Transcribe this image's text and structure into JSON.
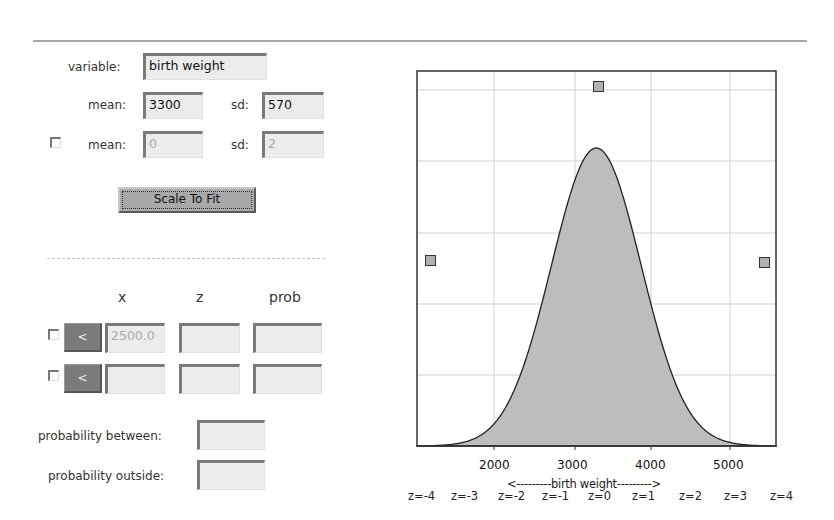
{
  "params": {
    "variable_label": "variable:",
    "variable_value": "birth weight",
    "mean_label": "mean:",
    "mean_value": "3300",
    "sd_label": "sd:",
    "sd_value": "570",
    "alt_mean_label": "mean:",
    "alt_mean_value": "0",
    "alt_sd_label": "sd:",
    "alt_sd_value": "2",
    "alt_checked": false
  },
  "scale_button_label": "Scale To Fit",
  "calc": {
    "headers": {
      "x": "x",
      "z": "z",
      "prob": "prob"
    },
    "rows": [
      {
        "checked": false,
        "op_label": "<",
        "x": "2500.0",
        "z": "",
        "prob": ""
      },
      {
        "checked": false,
        "op_label": "<",
        "x": "",
        "z": "",
        "prob": ""
      }
    ],
    "prob_between_label": "probability between:",
    "prob_between_value": "",
    "prob_outside_label": "probability outside:",
    "prob_outside_value": ""
  },
  "chart_data": {
    "type": "area",
    "title": "",
    "xlabel": "<---------birth weight--------->",
    "ylabel": "",
    "distribution": "normal",
    "mean": 3300,
    "sd": 570,
    "xlim": [
      1010,
      5570
    ],
    "x_ticks": [
      2000,
      3000,
      4000,
      5000
    ],
    "x_tick_labels": [
      "2000",
      "3000",
      "4000",
      "5000"
    ],
    "z_labels": [
      "z=-4",
      "z=-3",
      "z=-2",
      "z=-1",
      "z=0",
      "z=1",
      "z=2",
      "z=3",
      "z=4"
    ],
    "grid": true,
    "fill_color": "#bdbdbd",
    "handles": [
      {
        "name": "peak-height-handle",
        "x": 3300
      },
      {
        "name": "left-range-handle",
        "x": 1190
      },
      {
        "name": "right-range-handle",
        "x": 5500
      }
    ]
  }
}
